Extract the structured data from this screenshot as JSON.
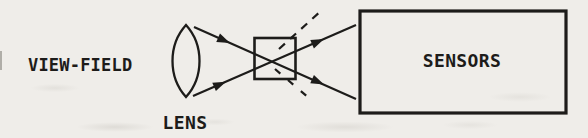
{
  "canvas": {
    "width": 588,
    "height": 138,
    "background": "#efede9",
    "ink": "#1d1c1a"
  },
  "diagram": {
    "type": "optical-schematic",
    "labels": {
      "view_field": "VIEW-FIELD",
      "lens": "LENS",
      "sensors": "SENSORS"
    }
  }
}
